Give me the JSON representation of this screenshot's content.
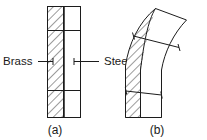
{
  "figure": {
    "background_color": "#ffffff",
    "line_color": "#1c1c1c",
    "hatch_color": "#555555",
    "labels": {
      "brass": "Brass",
      "steel": "Steel"
    },
    "captions": {
      "a": "(a)",
      "b": "(b)"
    },
    "panels": [
      {
        "id": "a",
        "caption": "(a)",
        "state": "straight",
        "materials": [
          {
            "name": "Brass",
            "side": "left",
            "pattern": "hatched"
          },
          {
            "name": "Steel",
            "side": "right",
            "pattern": "plain"
          }
        ],
        "division_lines": 2
      },
      {
        "id": "b",
        "caption": "(b)",
        "state": "bent",
        "materials": [
          {
            "name": "Brass",
            "side": "outer-left",
            "pattern": "hatched"
          },
          {
            "name": "Steel",
            "side": "inner-right",
            "pattern": "plain"
          }
        ],
        "division_lines": 2
      }
    ]
  }
}
